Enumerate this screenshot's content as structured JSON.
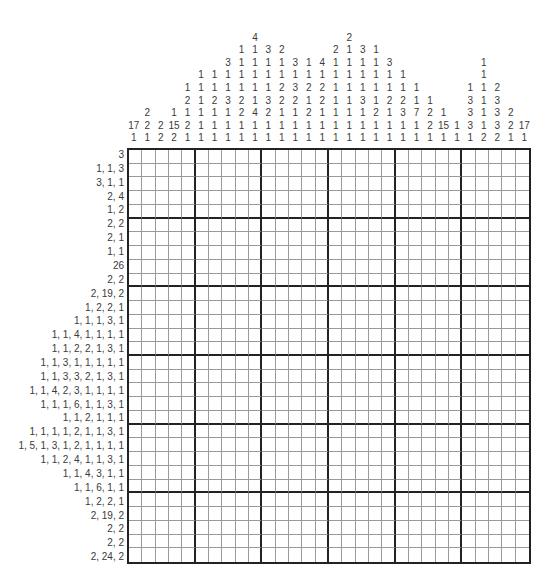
{
  "puzzle": {
    "type": "nonogram",
    "size": {
      "rows": 30,
      "cols": 30
    },
    "column_clues": [
      [
        17,
        1
      ],
      [
        2,
        2,
        1
      ],
      [
        2,
        2
      ],
      [
        1,
        15,
        2
      ],
      [
        1,
        2,
        1,
        2,
        1
      ],
      [
        1,
        1,
        1,
        1,
        1,
        1
      ],
      [
        1,
        1,
        2,
        1,
        1,
        1
      ],
      [
        3,
        1,
        1,
        3,
        1,
        1,
        1
      ],
      [
        1,
        1,
        1,
        1,
        2,
        2,
        1,
        1
      ],
      [
        4,
        1,
        1,
        1,
        1,
        1,
        4,
        1,
        1
      ],
      [
        3,
        1,
        1,
        1,
        3,
        2,
        1,
        1
      ],
      [
        2,
        1,
        1,
        2,
        2,
        1,
        1,
        1
      ],
      [
        3,
        1,
        3,
        2,
        1,
        1,
        1
      ],
      [
        1,
        1,
        2,
        1,
        2,
        1,
        1
      ],
      [
        4,
        1,
        2,
        2,
        1,
        1,
        1
      ],
      [
        2,
        1,
        1,
        1,
        1,
        1,
        1,
        1
      ],
      [
        2,
        1,
        1,
        1,
        1,
        1,
        1,
        1,
        1
      ],
      [
        3,
        1,
        1,
        1,
        3,
        1,
        1,
        1
      ],
      [
        1,
        1,
        1,
        1,
        1,
        2,
        1,
        1
      ],
      [
        3,
        1,
        1,
        2,
        1,
        1,
        1
      ],
      [
        1,
        1,
        2,
        3,
        1,
        1
      ],
      [
        1,
        1,
        7,
        1,
        1
      ],
      [
        1,
        2,
        2,
        1
      ],
      [
        1,
        15,
        1
      ],
      [
        1,
        1
      ],
      [
        1,
        3,
        3,
        3,
        1
      ],
      [
        1,
        1,
        1,
        1,
        1,
        1,
        2
      ],
      [
        2,
        3,
        3,
        3,
        2
      ],
      [
        2,
        2,
        1
      ],
      [
        17,
        1
      ]
    ],
    "row_clues": [
      "3",
      "1, 1, 3",
      "3, 1, 1",
      "2, 4",
      "1, 2",
      "2, 2",
      "2, 1",
      "1, 1",
      "26",
      "2, 2",
      "2, 19, 2",
      "1, 2, 2, 1",
      "1, 1, 1, 3, 1",
      "1, 1, 4, 1, 1, 1, 1",
      "1, 1, 2, 2, 1, 3, 1",
      "1, 1, 3, 1, 1, 1, 1, 1",
      "1, 1, 3, 3, 2, 1, 3, 1",
      "1, 1, 4, 2, 3, 1, 1, 1, 1",
      "1, 1, 1, 6, 1, 1, 3, 1",
      "1, 1, 2, 1, 1, 1",
      "1, 1, 1, 1, 2, 1, 1, 3, 1",
      "1, 5, 1, 3, 1, 2, 1, 1, 1, 1",
      "1, 1, 2, 4, 1, 1, 3, 1",
      "1, 1, 4, 3, 1, 1",
      "1, 1, 6, 1, 1",
      "1, 2, 2, 1",
      "2, 19, 2",
      "2, 2",
      "2, 2",
      "2, 24, 2"
    ],
    "colors": {
      "clue_text": "#3a3a3a",
      "thick_line": "#222222",
      "thin_line": "#9a9a9a",
      "background": "#ffffff"
    }
  }
}
